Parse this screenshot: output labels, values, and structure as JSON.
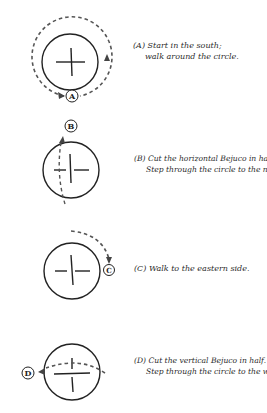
{
  "steps": [
    {
      "label": "A",
      "caption_line1": "(A) Start in the south;",
      "caption_line2": "walk around the circle."
    },
    {
      "label": "B",
      "caption_line1": "(B) Cut the horizontal Bejuco in half.",
      "caption_line2": "Step through the circle to the north."
    },
    {
      "label": "C",
      "caption_line1": "(C) Walk to the eastern side.",
      "caption_line2": ""
    },
    {
      "label": "D",
      "caption_line1": "(D) Cut the vertical Bejuco in half.",
      "caption_line2": "Step through the circle to the west."
    }
  ],
  "colors": {
    "line": "#222222",
    "dashed": "#555555"
  }
}
